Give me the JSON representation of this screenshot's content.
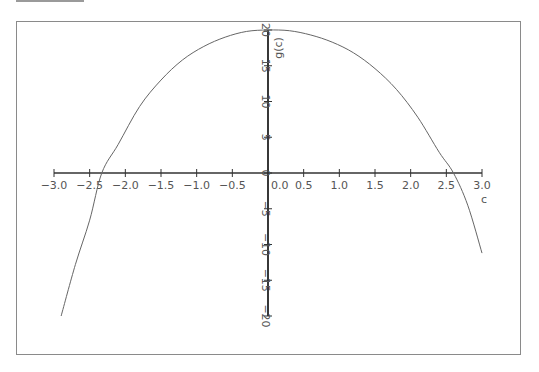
{
  "chart_data": {
    "type": "line",
    "title": "",
    "xlabel": "c",
    "ylabel": "g(c)",
    "xlim": [
      -3.0,
      3.0
    ],
    "ylim": [
      -20,
      20
    ],
    "grid": false,
    "legend": null,
    "x_ticks": [
      "-3.0",
      "-2.5",
      "-2.0",
      "-1.5",
      "-1.0",
      "-0.5",
      "0.0",
      "0.5",
      "1.0",
      "1.5",
      "2.0",
      "2.5",
      "3.0"
    ],
    "y_ticks": [
      "-20",
      "-15",
      "-10",
      "-5",
      "0",
      "5",
      "10",
      "15",
      "20"
    ],
    "series": [
      {
        "name": "g(c)",
        "x": [
          -2.9,
          -2.7,
          -2.5,
          -2.33,
          -2.1,
          -1.8,
          -1.5,
          -1.2,
          -0.9,
          -0.6,
          -0.3,
          0.0,
          0.3,
          0.6,
          0.9,
          1.2,
          1.5,
          1.8,
          2.1,
          2.4,
          2.6,
          2.8,
          3.0
        ],
        "values": [
          -20.0,
          -12.8,
          -6.6,
          0.0,
          4.0,
          9.3,
          13.0,
          15.8,
          17.7,
          19.0,
          19.8,
          20.0,
          19.9,
          19.3,
          18.3,
          16.8,
          14.6,
          11.7,
          7.8,
          2.9,
          0.0,
          -4.5,
          -11.2
        ]
      }
    ],
    "root_annotations": [
      -2.33,
      2.6
    ]
  }
}
